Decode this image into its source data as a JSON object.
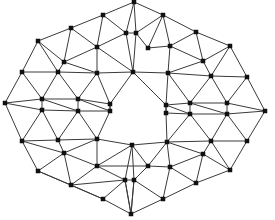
{
  "figure": {
    "type": "node-link-diagram",
    "background_color": "#ffffff",
    "node_color": "#111111",
    "edge_color": "#3a3a3a",
    "node_shape": "square",
    "node_size_px": 4,
    "edge_width_px": 1,
    "node_count": 56,
    "edge_count": 140,
    "width_px": 275,
    "height_px": 220,
    "caption": ""
  },
  "chart_data": {
    "type": "scatter",
    "xlabel": "",
    "ylabel": "",
    "xlim": [
      0,
      275
    ],
    "ylim": [
      0,
      220
    ],
    "grid": false,
    "legend": "none",
    "nodes": [
      {
        "id": 0,
        "x": 134,
        "y": 2
      },
      {
        "id": 1,
        "x": 103,
        "y": 15
      },
      {
        "id": 2,
        "x": 163,
        "y": 15
      },
      {
        "id": 3,
        "x": 71,
        "y": 28
      },
      {
        "id": 4,
        "x": 126,
        "y": 33
      },
      {
        "id": 5,
        "x": 136,
        "y": 33
      },
      {
        "id": 6,
        "x": 196,
        "y": 32
      },
      {
        "id": 7,
        "x": 38,
        "y": 41
      },
      {
        "id": 8,
        "x": 97,
        "y": 47
      },
      {
        "id": 9,
        "x": 170,
        "y": 46
      },
      {
        "id": 10,
        "x": 230,
        "y": 46
      },
      {
        "id": 11,
        "x": 64,
        "y": 62
      },
      {
        "id": 12,
        "x": 203,
        "y": 61
      },
      {
        "id": 13,
        "x": 22,
        "y": 72
      },
      {
        "id": 14,
        "x": 58,
        "y": 72
      },
      {
        "id": 15,
        "x": 97,
        "y": 73
      },
      {
        "id": 16,
        "x": 133,
        "y": 72
      },
      {
        "id": 17,
        "x": 168,
        "y": 73
      },
      {
        "id": 18,
        "x": 211,
        "y": 76
      },
      {
        "id": 19,
        "x": 247,
        "y": 77
      },
      {
        "id": 20,
        "x": 5,
        "y": 103
      },
      {
        "id": 21,
        "x": 42,
        "y": 99
      },
      {
        "id": 22,
        "x": 78,
        "y": 99
      },
      {
        "id": 23,
        "x": 110,
        "y": 104
      },
      {
        "id": 24,
        "x": 166,
        "y": 105
      },
      {
        "id": 25,
        "x": 190,
        "y": 103
      },
      {
        "id": 26,
        "x": 227,
        "y": 103
      },
      {
        "id": 27,
        "x": 265,
        "y": 111
      },
      {
        "id": 28,
        "x": 42,
        "y": 110
      },
      {
        "id": 29,
        "x": 78,
        "y": 111
      },
      {
        "id": 30,
        "x": 110,
        "y": 111
      },
      {
        "id": 31,
        "x": 166,
        "y": 113
      },
      {
        "id": 32,
        "x": 190,
        "y": 114
      },
      {
        "id": 33,
        "x": 227,
        "y": 114
      },
      {
        "id": 34,
        "x": 22,
        "y": 141
      },
      {
        "id": 35,
        "x": 58,
        "y": 140
      },
      {
        "id": 36,
        "x": 97,
        "y": 139
      },
      {
        "id": 37,
        "x": 132,
        "y": 145
      },
      {
        "id": 38,
        "x": 167,
        "y": 142
      },
      {
        "id": 39,
        "x": 211,
        "y": 141
      },
      {
        "id": 40,
        "x": 247,
        "y": 141
      },
      {
        "id": 41,
        "x": 64,
        "y": 153
      },
      {
        "id": 42,
        "x": 203,
        "y": 154
      },
      {
        "id": 43,
        "x": 38,
        "y": 171
      },
      {
        "id": 44,
        "x": 97,
        "y": 166
      },
      {
        "id": 45,
        "x": 170,
        "y": 167
      },
      {
        "id": 46,
        "x": 230,
        "y": 170
      },
      {
        "id": 47,
        "x": 71,
        "y": 185
      },
      {
        "id": 48,
        "x": 125,
        "y": 180
      },
      {
        "id": 49,
        "x": 134,
        "y": 180
      },
      {
        "id": 50,
        "x": 196,
        "y": 183
      },
      {
        "id": 51,
        "x": 103,
        "y": 199
      },
      {
        "id": 52,
        "x": 163,
        "y": 199
      },
      {
        "id": 53,
        "x": 131,
        "y": 214
      },
      {
        "id": 54,
        "x": 148,
        "y": 48
      },
      {
        "id": 55,
        "x": 148,
        "y": 166
      }
    ],
    "edges": [
      [
        0,
        1
      ],
      [
        0,
        2
      ],
      [
        0,
        4
      ],
      [
        0,
        5
      ],
      [
        1,
        3
      ],
      [
        1,
        4
      ],
      [
        1,
        8
      ],
      [
        2,
        5
      ],
      [
        2,
        6
      ],
      [
        2,
        54
      ],
      [
        2,
        9
      ],
      [
        3,
        7
      ],
      [
        3,
        8
      ],
      [
        3,
        11
      ],
      [
        4,
        5
      ],
      [
        4,
        8
      ],
      [
        4,
        16
      ],
      [
        5,
        16
      ],
      [
        5,
        54
      ],
      [
        6,
        9
      ],
      [
        6,
        10
      ],
      [
        6,
        12
      ],
      [
        7,
        11
      ],
      [
        7,
        13
      ],
      [
        7,
        14
      ],
      [
        8,
        11
      ],
      [
        8,
        15
      ],
      [
        8,
        16
      ],
      [
        9,
        12
      ],
      [
        9,
        17
      ],
      [
        9,
        54
      ],
      [
        10,
        12
      ],
      [
        10,
        18
      ],
      [
        10,
        19
      ],
      [
        11,
        14
      ],
      [
        11,
        15
      ],
      [
        12,
        17
      ],
      [
        12,
        18
      ],
      [
        13,
        14
      ],
      [
        13,
        20
      ],
      [
        13,
        21
      ],
      [
        14,
        21
      ],
      [
        14,
        22
      ],
      [
        14,
        15
      ],
      [
        15,
        16
      ],
      [
        15,
        22
      ],
      [
        15,
        23
      ],
      [
        16,
        17
      ],
      [
        16,
        23
      ],
      [
        16,
        24
      ],
      [
        17,
        18
      ],
      [
        17,
        24
      ],
      [
        17,
        25
      ],
      [
        18,
        19
      ],
      [
        18,
        25
      ],
      [
        18,
        26
      ],
      [
        19,
        26
      ],
      [
        19,
        27
      ],
      [
        20,
        21
      ],
      [
        20,
        28
      ],
      [
        20,
        34
      ],
      [
        21,
        22
      ],
      [
        21,
        28
      ],
      [
        21,
        29
      ],
      [
        22,
        23
      ],
      [
        22,
        29
      ],
      [
        22,
        30
      ],
      [
        23,
        30
      ],
      [
        24,
        25
      ],
      [
        24,
        31
      ],
      [
        24,
        32
      ],
      [
        25,
        26
      ],
      [
        25,
        32
      ],
      [
        25,
        33
      ],
      [
        26,
        27
      ],
      [
        26,
        33
      ],
      [
        27,
        33
      ],
      [
        27,
        40
      ],
      [
        28,
        29
      ],
      [
        28,
        34
      ],
      [
        28,
        35
      ],
      [
        29,
        30
      ],
      [
        29,
        35
      ],
      [
        29,
        36
      ],
      [
        30,
        36
      ],
      [
        30,
        23
      ],
      [
        31,
        32
      ],
      [
        31,
        38
      ],
      [
        31,
        24
      ],
      [
        32,
        33
      ],
      [
        32,
        38
      ],
      [
        32,
        39
      ],
      [
        33,
        39
      ],
      [
        33,
        40
      ],
      [
        34,
        35
      ],
      [
        34,
        41
      ],
      [
        34,
        43
      ],
      [
        35,
        36
      ],
      [
        35,
        41
      ],
      [
        36,
        37
      ],
      [
        36,
        41
      ],
      [
        36,
        44
      ],
      [
        37,
        38
      ],
      [
        37,
        44
      ],
      [
        37,
        48
      ],
      [
        37,
        49
      ],
      [
        37,
        55
      ],
      [
        38,
        39
      ],
      [
        38,
        42
      ],
      [
        38,
        55
      ],
      [
        38,
        45
      ],
      [
        39,
        40
      ],
      [
        39,
        42
      ],
      [
        39,
        46
      ],
      [
        40,
        46
      ],
      [
        41,
        43
      ],
      [
        41,
        44
      ],
      [
        41,
        47
      ],
      [
        42,
        45
      ],
      [
        42,
        46
      ],
      [
        42,
        50
      ],
      [
        43,
        47
      ],
      [
        43,
        51
      ],
      [
        44,
        47
      ],
      [
        44,
        48
      ],
      [
        44,
        55
      ],
      [
        45,
        50
      ],
      [
        45,
        52
      ],
      [
        45,
        55
      ],
      [
        46,
        50
      ],
      [
        47,
        48
      ],
      [
        47,
        51
      ],
      [
        48,
        49
      ],
      [
        48,
        51
      ],
      [
        48,
        53
      ],
      [
        49,
        52
      ],
      [
        49,
        53
      ],
      [
        49,
        55
      ],
      [
        50,
        52
      ],
      [
        51,
        53
      ],
      [
        52,
        53
      ],
      [
        53,
        48
      ],
      [
        53,
        49
      ]
    ]
  }
}
